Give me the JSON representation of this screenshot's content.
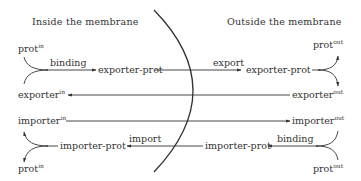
{
  "headings": {
    "inside": "Inside the membrane",
    "outside": "Outside the membrane"
  },
  "species": {
    "prot_in_top": {
      "base": "prot",
      "sup": "in"
    },
    "prot_out_top": {
      "base": "prot",
      "sup": "out"
    },
    "exporter_prot_in": "exporter-prot",
    "exporter_prot_out": "exporter-prot",
    "exporter_in": {
      "base": "exporter",
      "sup": "in"
    },
    "exporter_out": {
      "base": "exporter",
      "sup": "out"
    },
    "importer_in": {
      "base": "importer",
      "sup": "in"
    },
    "importer_out": {
      "base": "importer",
      "sup": "out"
    },
    "importer_prot_in": "importer-prot",
    "importer_prot_out": "importer-prot",
    "prot_in_bottom": {
      "base": "prot",
      "sup": "in"
    },
    "prot_out_bottom": {
      "base": "prot",
      "sup": "out"
    }
  },
  "reactions": {
    "binding_in": "binding",
    "export": "export",
    "import": "import",
    "binding_out": "binding"
  },
  "colors": {
    "ink": "#333333",
    "background": "#ffffff"
  }
}
